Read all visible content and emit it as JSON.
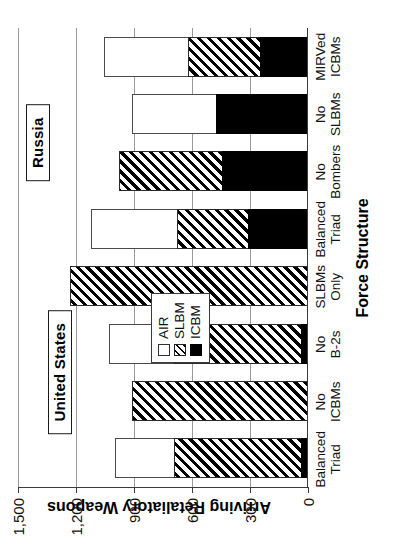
{
  "chart_data": {
    "type": "bar",
    "subtype": "stacked-vertical-bar",
    "title": "",
    "xlabel": "Force Structure",
    "ylabel": "Arriving Retaliatory Weapons",
    "ylim": [
      0,
      1500
    ],
    "yticks": [
      0,
      300,
      600,
      900,
      1200,
      1500
    ],
    "ytick_labels": [
      "0",
      "300",
      "600",
      "900",
      "1,200",
      "1,500"
    ],
    "grid": true,
    "legend_position": "inside-left-middle",
    "categories": [
      "Balanced\nTriad",
      "No\nICBMs",
      "No\nB-2s",
      "SLBMs\nOnly",
      "Balanced\nTriad",
      "No\nBombers",
      "No\nSLBMs",
      "MIRVed\nICBMs"
    ],
    "category_labels": [
      [
        "Balanced",
        "Triad"
      ],
      [
        "No",
        "ICBMs"
      ],
      [
        "No",
        "B-2s"
      ],
      [
        "SLBMs",
        "Only"
      ],
      [
        "Balanced",
        "Triad"
      ],
      [
        "No",
        "Bombers"
      ],
      [
        "No",
        "SLBMs"
      ],
      [
        "MIRVed",
        "ICBMs"
      ]
    ],
    "series": [
      {
        "name": "ICBM",
        "values": [
          30,
          0,
          30,
          0,
          305,
          438,
          471,
          245
        ]
      },
      {
        "name": "SLBM",
        "values": [
          657,
          905,
          657,
          1227,
          369,
          535,
          0,
          369
        ]
      },
      {
        "name": "AIR",
        "values": [
          305,
          0,
          335,
          0,
          443,
          0,
          434,
          438
        ]
      }
    ],
    "totals": [
      992,
      905,
      1022,
      1227,
      1117,
      973,
      905,
      1052
    ],
    "groups": [
      {
        "label": "United States",
        "start_index": 0,
        "end_index": 3
      },
      {
        "label": "Russia",
        "start_index": 4,
        "end_index": 7
      }
    ]
  },
  "legend": {
    "items": [
      {
        "label": "AIR",
        "style": "open"
      },
      {
        "label": "SLBM",
        "style": "hatched"
      },
      {
        "label": "ICBM",
        "style": "solid-black"
      }
    ]
  },
  "colors": {
    "icbm": "#000000",
    "slbm_hatch": "#000000",
    "air_fill": "#ffffff",
    "axis": "#3a3a3a",
    "grid": "#9a9a9a"
  }
}
